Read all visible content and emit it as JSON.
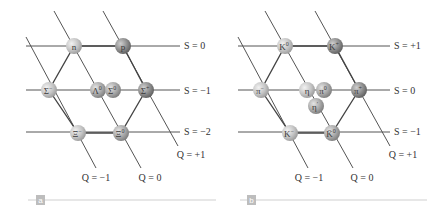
{
  "panels": [
    {
      "tag": "a",
      "title": "Baryon octet",
      "particles": [
        {
          "name": "n",
          "base": "n",
          "sup": "",
          "x": 74,
          "y": 46,
          "shade": "light"
        },
        {
          "name": "p",
          "base": "p",
          "sup": "",
          "x": 123,
          "y": 46,
          "shade": "dark"
        },
        {
          "name": "Sigma-minus",
          "base": "Σ",
          "sup": "−",
          "x": 49,
          "y": 90,
          "shade": "light"
        },
        {
          "name": "Lambda-0",
          "base": "Λ",
          "sup": "0",
          "x": 98,
          "y": 90,
          "shade": "medium"
        },
        {
          "name": "Sigma-0",
          "base": "Σ",
          "sup": "0",
          "x": 113,
          "y": 90,
          "shade": "medium"
        },
        {
          "name": "Sigma-plus",
          "base": "Σ",
          "sup": "+",
          "x": 146,
          "y": 90,
          "shade": "dark"
        },
        {
          "name": "Xi-minus",
          "base": "Ξ",
          "sup": "−",
          "x": 78,
          "y": 133,
          "shade": "light"
        },
        {
          "name": "Xi-0",
          "base": "Ξ",
          "sup": "0",
          "x": 121,
          "y": 133,
          "shade": "medium"
        }
      ],
      "strangeness_labels": [
        {
          "text": "S = 0",
          "y": 46
        },
        {
          "text": "S = −1",
          "y": 91
        },
        {
          "text": "S = −2",
          "y": 132
        }
      ],
      "charge_labels": [
        {
          "text": "Q = −1",
          "x": 96,
          "y": 178
        },
        {
          "text": "Q = 0",
          "x": 150,
          "y": 178
        },
        {
          "text": "Q = +1",
          "x": 191,
          "y": 155
        }
      ]
    },
    {
      "tag": "b",
      "title": "Meson nonet",
      "particles": [
        {
          "name": "K-0",
          "base": "K",
          "sup": "0",
          "x": 285,
          "y": 46,
          "shade": "light"
        },
        {
          "name": "K-plus",
          "base": "K",
          "sup": "+",
          "x": 335,
          "y": 46,
          "shade": "dark"
        },
        {
          "name": "pi-minus",
          "base": "π",
          "sup": "−",
          "x": 261,
          "y": 90,
          "shade": "light"
        },
        {
          "name": "eta",
          "base": "η",
          "sup": "",
          "x": 307,
          "y": 90,
          "shade": "light"
        },
        {
          "name": "pi-0",
          "base": "π",
          "sup": "0",
          "x": 324,
          "y": 90,
          "shade": "medium"
        },
        {
          "name": "eta-prime",
          "base": "η",
          "sup": "′",
          "x": 316,
          "y": 106,
          "shade": "medium"
        },
        {
          "name": "pi-plus",
          "base": "π",
          "sup": "+",
          "x": 359,
          "y": 90,
          "shade": "dark"
        },
        {
          "name": "K-minus",
          "base": "K",
          "sup": "−",
          "x": 290,
          "y": 133,
          "shade": "light"
        },
        {
          "name": "K-bar-0",
          "base": "K̄",
          "sup": "0",
          "x": 332,
          "y": 133,
          "shade": "medium"
        }
      ],
      "strangeness_labels": [
        {
          "text": "S = +1",
          "y": 46
        },
        {
          "text": "S = 0",
          "y": 91
        },
        {
          "text": "S = −1",
          "y": 132
        }
      ],
      "charge_labels": [
        {
          "text": "Q = −1",
          "x": 309,
          "y": 178
        },
        {
          "text": "Q = 0",
          "x": 362,
          "y": 178
        },
        {
          "text": "Q = +1",
          "x": 403,
          "y": 155
        }
      ]
    }
  ],
  "colors": {
    "light": "#c9c9c9",
    "medium": "#a9a9a9",
    "dark": "#8a8a8a",
    "line": "#555555",
    "tag": "#bdbdbd"
  }
}
